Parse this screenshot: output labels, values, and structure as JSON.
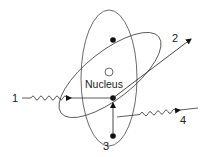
{
  "diagram": {
    "title": "",
    "nucleus_label": "Nucleus",
    "labels": {
      "ray1": "1",
      "ray2": "2",
      "ray3": "3",
      "ray4": "4"
    },
    "colors": {
      "stroke": "#333333",
      "electron": "#111111",
      "background": "#ffffff"
    },
    "elements": [
      {
        "id": "orbit-vertical",
        "type": "ellipse"
      },
      {
        "id": "orbit-tilted",
        "type": "ellipse"
      },
      {
        "id": "nucleus",
        "type": "open-circle"
      },
      {
        "id": "electron-top",
        "type": "filled-circle"
      },
      {
        "id": "electron-center",
        "type": "filled-circle"
      },
      {
        "id": "electron-bottom",
        "type": "filled-circle"
      },
      {
        "id": "ray-1",
        "type": "wavy-arrow",
        "label": "1"
      },
      {
        "id": "ray-2",
        "type": "straight-arrow",
        "label": "2"
      },
      {
        "id": "ray-3",
        "type": "vertical-transition",
        "label": "3"
      },
      {
        "id": "ray-4",
        "type": "wavy-arrow",
        "label": "4"
      }
    ]
  }
}
